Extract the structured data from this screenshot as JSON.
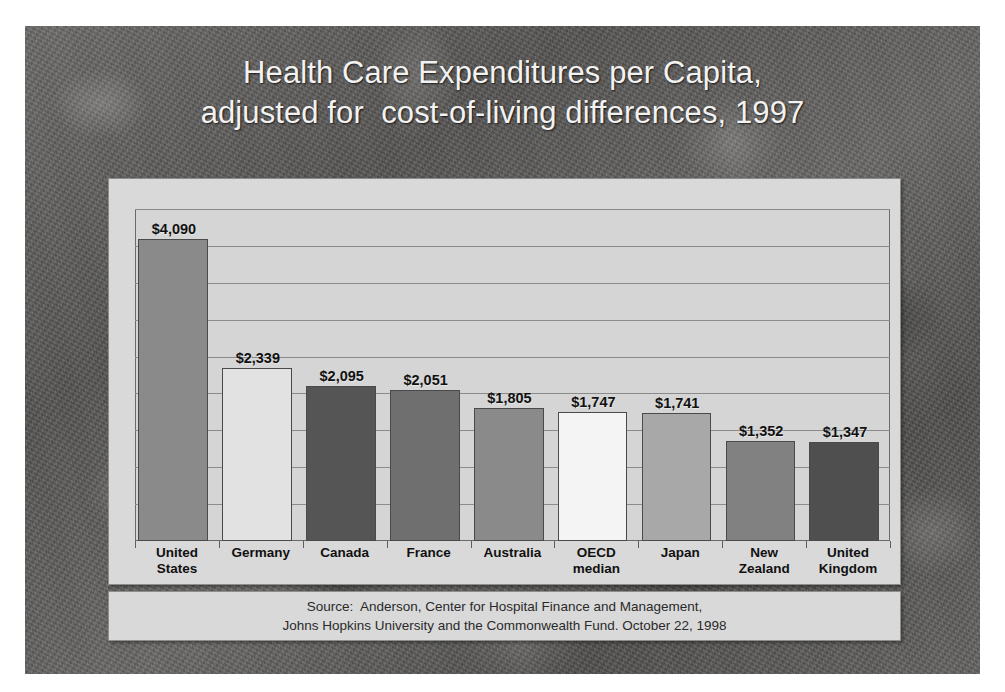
{
  "slide": {
    "title_line1": "Health Care Expenditures per Capita,",
    "title_line2": "adjusted for  cost-of-living differences, 1997",
    "title_color": "#f2f2f2",
    "background_color": "#605f5e",
    "panel_color": "#d9d9d9"
  },
  "source": {
    "line1": "Source:  Anderson, Center for Hospital Finance and Management,",
    "line2": "Johns Hopkins University and the Commonwealth Fund. October 22, 1998"
  },
  "chart_data": {
    "type": "bar",
    "title": "Health Care Expenditures per Capita, adjusted for  cost-of-living differences, 1997",
    "xlabel": "",
    "ylabel": "",
    "ylim": [
      0,
      4500
    ],
    "grid": true,
    "gridline_interval": 500,
    "legend": "none",
    "categories": [
      "United States",
      "Germany",
      "Canada",
      "France",
      "Australia",
      "OECD median",
      "Japan",
      "New Zealand",
      "United Kingdom"
    ],
    "category_labels": [
      "United\nStates",
      "Germany",
      "Canada",
      "France",
      "Australia",
      "OECD\nmedian",
      "Japan",
      "New\nZealand",
      "United\nKingdom"
    ],
    "values": [
      4090,
      2339,
      2095,
      2051,
      1805,
      1747,
      1741,
      1352,
      1347
    ],
    "data_labels": [
      "$4,090",
      "$2,339",
      "$2,095",
      "$2,051",
      "$1,805",
      "$1,747",
      "$1,741",
      "$1,352",
      "$1,347"
    ],
    "bar_colors": [
      "#8a8a8a",
      "#e2e2e2",
      "#555555",
      "#6f6f6f",
      "#8a8a8a",
      "#f4f4f4",
      "#a8a8a8",
      "#818181",
      "#4f4f4f"
    ],
    "currency": "USD",
    "unit": "dollars per capita"
  }
}
